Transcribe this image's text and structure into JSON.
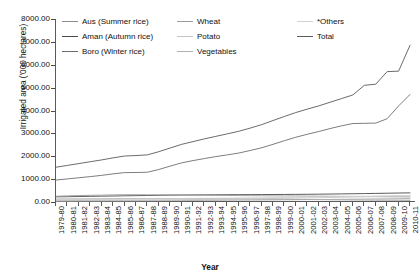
{
  "chart_data": {
    "type": "line",
    "title": "",
    "xlabel": "Year",
    "ylabel": "Irrigated area ('000 hectares)",
    "ylim": [
      0,
      8000
    ],
    "yticks": [
      "0.00",
      "1000.00",
      "2000.00",
      "3000.00",
      "4000.00",
      "5000.00",
      "6000.00",
      "7000.00",
      "8000.00"
    ],
    "ytick_values": [
      0,
      1000,
      2000,
      3000,
      4000,
      5000,
      6000,
      7000,
      8000
    ],
    "grid": false,
    "legend_position": "top-inside",
    "categories": [
      "1979-80",
      "1980-81",
      "1981-82",
      "1982-83",
      "1983-84",
      "1984-85",
      "1985-86",
      "1986-87",
      "1987-88",
      "1988-89",
      "1989-90",
      "1990-91",
      "1991-92",
      "1992-93",
      "1993-94",
      "1994-95",
      "1995-96",
      "1996-97",
      "1997-98",
      "1998-99",
      "1999-00",
      "2000-01",
      "2001-02",
      "2002-03",
      "2003-04",
      "2004-05",
      "2005-06",
      "2006-07",
      "2007-08",
      "2008-09",
      "2009-10",
      "2010-11"
    ],
    "series": [
      {
        "name": "Aus (Summer rice)",
        "color": "#8c8c8c",
        "values": [
          125,
          128,
          130,
          132,
          135,
          140,
          143,
          145,
          148,
          150,
          150,
          148,
          145,
          142,
          140,
          138,
          135,
          130,
          126,
          122,
          118,
          112,
          108,
          104,
          100,
          96,
          92,
          88,
          85,
          82,
          80,
          78
        ]
      },
      {
        "name": "Aman (Autumn rice)",
        "color": "#4a4a4a",
        "values": [
          225,
          232,
          240,
          248,
          255,
          262,
          270,
          278,
          285,
          292,
          300,
          305,
          310,
          312,
          315,
          318,
          320,
          322,
          325,
          328,
          330,
          334,
          338,
          342,
          348,
          354,
          360,
          368,
          376,
          384,
          392,
          400
        ]
      },
      {
        "name": "Boro (Winter rice)",
        "color": "#6e6e6e",
        "values": [
          960,
          1010,
          1060,
          1110,
          1165,
          1230,
          1285,
          1290,
          1300,
          1420,
          1570,
          1710,
          1810,
          1900,
          1985,
          2060,
          2140,
          2250,
          2370,
          2520,
          2680,
          2830,
          2960,
          3080,
          3210,
          3330,
          3430,
          3440,
          3450,
          3640,
          4200,
          4700
        ]
      },
      {
        "name": "Wheat",
        "color": "#9a9a9a",
        "values": [
          250,
          268,
          280,
          292,
          300,
          312,
          320,
          318,
          315,
          312,
          310,
          305,
          300,
          295,
          290,
          285,
          280,
          276,
          272,
          268,
          266,
          262,
          258,
          254,
          250,
          246,
          242,
          238,
          234,
          230,
          226,
          222
        ]
      },
      {
        "name": "Potato",
        "color": "#c4c4c4",
        "values": [
          60,
          64,
          68,
          72,
          76,
          80,
          84,
          88,
          92,
          96,
          100,
          104,
          108,
          112,
          118,
          124,
          130,
          138,
          146,
          154,
          162,
          170,
          178,
          188,
          198,
          208,
          218,
          228,
          240,
          252,
          264,
          276
        ]
      },
      {
        "name": "Vegetables",
        "color": "#b0b0b0",
        "values": [
          40,
          42,
          44,
          46,
          48,
          50,
          52,
          54,
          56,
          58,
          60,
          62,
          65,
          68,
          71,
          74,
          78,
          82,
          86,
          90,
          94,
          98,
          103,
          108,
          113,
          118,
          124,
          130,
          136,
          142,
          148,
          155
        ]
      },
      {
        "name": "*Others",
        "color": "#d2d2d2",
        "values": [
          110,
          114,
          118,
          122,
          126,
          130,
          134,
          138,
          142,
          146,
          150,
          154,
          158,
          162,
          166,
          170,
          175,
          180,
          186,
          192,
          198,
          205,
          212,
          220,
          228,
          236,
          244,
          252,
          261,
          270,
          280,
          290
        ]
      },
      {
        "name": "Total",
        "color": "#5a5a5a",
        "values": [
          1520,
          1600,
          1680,
          1760,
          1840,
          1930,
          2010,
          2030,
          2060,
          2200,
          2360,
          2520,
          2640,
          2760,
          2870,
          2980,
          3090,
          3230,
          3380,
          3560,
          3740,
          3910,
          4060,
          4200,
          4360,
          4520,
          4680,
          5100,
          5150,
          5700,
          5720,
          6850
        ]
      }
    ]
  },
  "legend": {
    "items": [
      {
        "label": "Aus (Summer rice)",
        "color": "#8c8c8c"
      },
      {
        "label": "Aman (Autumn rice)",
        "color": "#4a4a4a"
      },
      {
        "label": "Boro (Winter rice)",
        "color": "#6e6e6e"
      },
      {
        "label": "Wheat",
        "color": "#9a9a9a"
      },
      {
        "label": "Potato",
        "color": "#c4c4c4"
      },
      {
        "label": "Vegetables",
        "color": "#b0b0b0"
      },
      {
        "label": "*Others",
        "color": "#d2d2d2"
      },
      {
        "label": "Total",
        "color": "#5a5a5a"
      }
    ]
  }
}
